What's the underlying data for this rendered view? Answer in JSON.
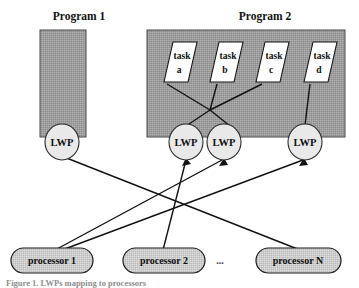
{
  "figure": {
    "caption": "Figure 1. LWPs mapping to processors",
    "ellipsis": "...",
    "colors": {
      "program_fill": "#9e9e9e",
      "lwp_fill": "#e8e8e8",
      "processor_fill": "#c9c9c9",
      "task_fill": "#ffffff",
      "line": "#121212",
      "text": "#101010"
    }
  },
  "programs": [
    {
      "title": "Program 1",
      "title_x": 79,
      "title_y": 20,
      "box": {
        "x": 40,
        "y": 30,
        "w": 46,
        "h": 107
      },
      "tasks": [],
      "lwps": [
        {
          "label": "LWP",
          "cx": 62,
          "cy": 142,
          "rx": 17,
          "ry": 18
        }
      ]
    },
    {
      "title": "Program 2",
      "title_x": 265,
      "title_y": 20,
      "box": {
        "x": 147,
        "y": 30,
        "w": 198,
        "h": 107
      },
      "tasks": [
        {
          "label_top": "task",
          "label_bottom": "a",
          "cx": 176,
          "cy": 62,
          "w": 34,
          "h": 40,
          "skew": 9
        },
        {
          "label_top": "task",
          "label_bottom": "b",
          "cx": 222,
          "cy": 62,
          "w": 34,
          "h": 40,
          "skew": 9
        },
        {
          "label_top": "task",
          "label_bottom": "c",
          "cx": 268,
          "cy": 62,
          "w": 34,
          "h": 40,
          "skew": 9
        },
        {
          "label_top": "task",
          "label_bottom": "d",
          "cx": 317,
          "cy": 62,
          "w": 34,
          "h": 40,
          "skew": 9
        }
      ],
      "lwps": [
        {
          "label": "LWP",
          "cx": 186,
          "cy": 142,
          "rx": 17,
          "ry": 18
        },
        {
          "label": "LWP",
          "cx": 224,
          "cy": 142,
          "rx": 17,
          "ry": 18
        },
        {
          "label": "LWP",
          "cx": 305,
          "cy": 142,
          "rx": 17,
          "ry": 18
        }
      ]
    }
  ],
  "processors": [
    {
      "label": "processor 1",
      "x": 11,
      "y": 248,
      "w": 82,
      "h": 25
    },
    {
      "label": "processor 2",
      "x": 123,
      "y": 248,
      "w": 82,
      "h": 25
    },
    {
      "label": "processor N",
      "x": 256,
      "y": 248,
      "w": 85,
      "h": 25
    }
  ],
  "ellipsis_marker": {
    "x": 220,
    "y": 263
  },
  "task_hub": {
    "x": 210,
    "y": 110
  },
  "processor_hub": {
    "x": 180,
    "y": 200
  },
  "task_links": [
    {
      "from_task": 0,
      "to": "hub"
    },
    {
      "from_task": 1,
      "to": "hub"
    },
    {
      "from_task": 2,
      "to": "hub"
    },
    {
      "from_task": 3,
      "to": "lwp3_direct"
    }
  ],
  "hub_to_lwp": [
    {
      "lwp_index": 0
    },
    {
      "lwp_index": 1
    }
  ],
  "lwp_processor_links": [
    {
      "lwp": "p1-lwp",
      "processor": "processor N"
    },
    {
      "lwp": "p2-lwp-1",
      "processor": "processor 1"
    },
    {
      "lwp": "p2-lwp-2",
      "processor": "processor 2"
    },
    {
      "lwp": "p2-lwp-3",
      "processor": "processor 1"
    }
  ]
}
